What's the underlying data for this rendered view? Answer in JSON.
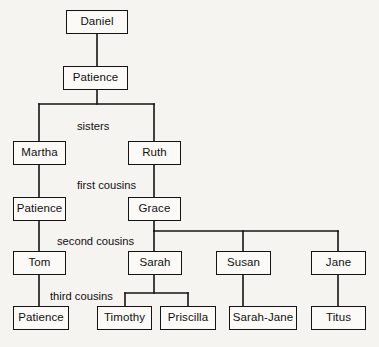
{
  "diagram": {
    "kind": "family-tree",
    "title": "",
    "colors": {
      "background": "#f6f4f0",
      "node_fill": "#fbfaf7",
      "stroke": "#141414",
      "text": "#111111"
    },
    "nodes": [
      {
        "id": "daniel",
        "label": "Daniel",
        "x": 66,
        "y": 10,
        "w": 62,
        "h": 24
      },
      {
        "id": "patience1",
        "label": "Patience",
        "x": 63,
        "y": 66,
        "w": 65,
        "h": 24
      },
      {
        "id": "martha",
        "label": "Martha",
        "x": 13,
        "y": 141,
        "w": 53,
        "h": 24
      },
      {
        "id": "ruth",
        "label": "Ruth",
        "x": 128,
        "y": 141,
        "w": 53,
        "h": 24
      },
      {
        "id": "patience2",
        "label": "Patience",
        "x": 13,
        "y": 197,
        "w": 53,
        "h": 24
      },
      {
        "id": "grace",
        "label": "Grace",
        "x": 128,
        "y": 197,
        "w": 53,
        "h": 24
      },
      {
        "id": "tom",
        "label": "Tom",
        "x": 13,
        "y": 251,
        "w": 53,
        "h": 24
      },
      {
        "id": "sarah",
        "label": "Sarah",
        "x": 128,
        "y": 251,
        "w": 54,
        "h": 24
      },
      {
        "id": "susan",
        "label": "Susan",
        "x": 216,
        "y": 251,
        "w": 55,
        "h": 24
      },
      {
        "id": "jane",
        "label": "Jane",
        "x": 311,
        "y": 251,
        "w": 55,
        "h": 24
      },
      {
        "id": "patience3",
        "label": "Patience",
        "x": 13,
        "y": 306,
        "w": 56,
        "h": 24
      },
      {
        "id": "timothy",
        "label": "Timothy",
        "x": 97,
        "y": 306,
        "w": 55,
        "h": 24
      },
      {
        "id": "priscilla",
        "label": "Priscilla",
        "x": 160,
        "y": 306,
        "w": 56,
        "h": 24
      },
      {
        "id": "sarahjane",
        "label": "Sarah-Jane",
        "x": 229,
        "y": 306,
        "w": 68,
        "h": 24
      },
      {
        "id": "titus",
        "label": "Titus",
        "x": 311,
        "y": 306,
        "w": 55,
        "h": 24
      }
    ],
    "edge_labels": [
      {
        "id": "sisters",
        "label": "sisters",
        "x": 77,
        "y": 121
      },
      {
        "id": "first-cousins",
        "label": "first cousins",
        "x": 77,
        "y": 180
      },
      {
        "id": "second-cousins",
        "label": "second cousins",
        "x": 57,
        "y": 236
      },
      {
        "id": "third-cousins",
        "label": "third cousins",
        "x": 50,
        "y": 291
      }
    ],
    "connectors": [
      {
        "id": "daniel-to-patience1",
        "points": "97,34 97,66"
      },
      {
        "id": "patience1-split",
        "points": "97,90 97,104"
      },
      {
        "id": "sisters-bus",
        "points": "39,104 154,104"
      },
      {
        "id": "bus-to-martha",
        "points": "39,104 39,141"
      },
      {
        "id": "bus-to-ruth",
        "points": "154,104 154,141"
      },
      {
        "id": "martha-to-patience2",
        "points": "39,165 39,197"
      },
      {
        "id": "ruth-to-grace",
        "points": "154,165 154,197"
      },
      {
        "id": "patience2-to-tom",
        "points": "39,221 39,251"
      },
      {
        "id": "grace-drop",
        "points": "154,221 154,231"
      },
      {
        "id": "grace-bus",
        "points": "154,231 338,231"
      },
      {
        "id": "bus-to-sarah",
        "points": "154,231 154,251"
      },
      {
        "id": "bus-to-susan",
        "points": "243,231 243,251"
      },
      {
        "id": "bus-to-jane",
        "points": "338,231 338,251"
      },
      {
        "id": "tom-to-patience3",
        "points": "39,275 39,306"
      },
      {
        "id": "sarah-drop",
        "points": "154,275 154,293"
      },
      {
        "id": "sarah-bus",
        "points": "125,293 188,293"
      },
      {
        "id": "bus-to-timothy",
        "points": "125,293 125,306"
      },
      {
        "id": "bus-to-priscilla",
        "points": "188,293 188,306"
      },
      {
        "id": "susan-to-sarahjane",
        "points": "243,275 243,306"
      },
      {
        "id": "jane-to-titus",
        "points": "338,275 338,306"
      }
    ]
  }
}
